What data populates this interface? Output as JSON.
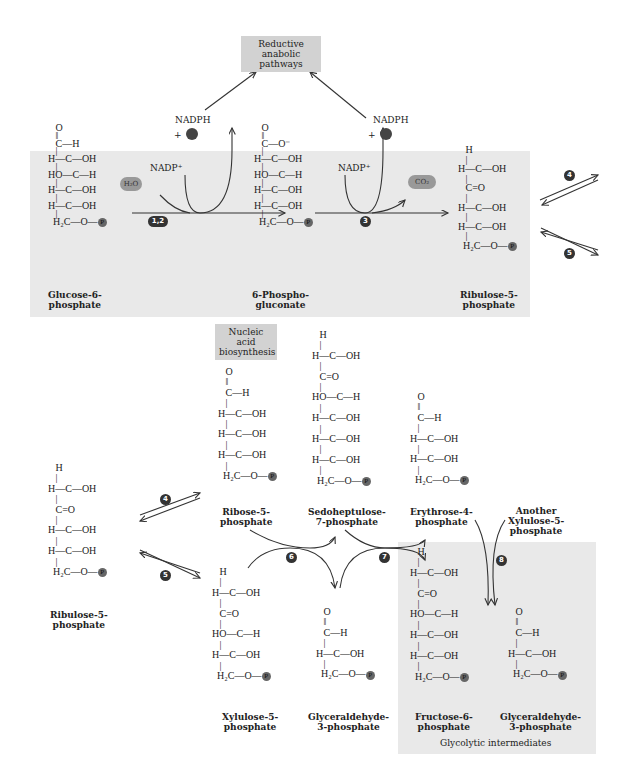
{
  "top_box": "Reductive anabolic pathways",
  "nadph": "NADPH",
  "plus": "+",
  "nadp": "NADP⁺",
  "h2o": "H₂O",
  "co2": "CO₂",
  "nucleic_box": "Nucleic acid biosynthesis",
  "glycolytic_label": "Glycolytic intermediates",
  "steps": {
    "s12": "1,2",
    "s3": "3",
    "s4": "4",
    "s5": "5",
    "s6": "6",
    "s7": "7",
    "s8": "8"
  },
  "molecules": {
    "glucose6p": {
      "name": "Glucose-6-\nphosphate",
      "structure": "   O\n   ‖\n   C—H\n   |\nH—C—OH\n   |\nHO—C—H\n   |\nH—C—OH\n   |\nH—C—OH\n   |\n  H₂C—O—"
    },
    "phosphogluconate": {
      "name": "6-Phospho-\ngluconate",
      "structure": "   O\n   ‖\n   C—O⁻\n   |\nH—C—OH\n   |\nHO—C—H\n   |\nH—C—OH\n   |\nH—C—OH\n   |\n  H₂C—O—"
    },
    "ribulose5p_top": {
      "name": "Ribulose-5-\nphosphate",
      "structure": "   H\n   |\nH—C—OH\n   |\n   C=O\n   |\nH—C—OH\n   |\nH—C—OH\n   |\n  H₂C—O—"
    },
    "ribulose5p_bottom": {
      "name": "Ribulose-5-\nphosphate",
      "structure": "   H\n   |\nH—C—OH\n   |\n   C=O\n   |\nH—C—OH\n   |\nH—C—OH\n   |\n  H₂C—O—"
    },
    "ribose5p": {
      "name": "Ribose-5-\nphosphate",
      "structure": "   O\n   ‖\n   C—H\n   |\nH—C—OH\n   |\nH—C—OH\n   |\nH—C—OH\n   |\n  H₂C—O—"
    },
    "sedoheptulose7p": {
      "name": "Sedoheptulose-\n7-phosphate",
      "structure": "   H\n   |\nH—C—OH\n   |\n   C=O\n   |\nHO—C—H\n   |\nH—C—OH\n   |\nH—C—OH\n   |\nH—C—OH\n   |\n  H₂C—O—"
    },
    "erythrose4p": {
      "name": "Erythrose-4-\nphosphate",
      "structure": "   O\n   ‖\n   C—H\n   |\nH—C—OH\n   |\nH—C—OH\n   |\n  H₂C—O—"
    },
    "xylulose5p": {
      "name": "Xylulose-5-\nphosphate",
      "structure": "   H\n   |\nH—C—OH\n   |\n   C=O\n   |\nHO—C—H\n   |\nH—C—OH\n   |\n  H₂C—O—"
    },
    "gap_mid": {
      "name": "Glyceraldehyde-\n3-phosphate",
      "structure": "   O\n   ‖\n   C—H\n   |\nH—C—OH\n   |\n  H₂C—O—"
    },
    "another_xylulose": {
      "name": "Another\nXylulose-5-\nphosphate"
    },
    "fructose6p": {
      "name": "Fructose-6-\nphosphate",
      "structure": "   H\n   |\nH—C—OH\n   |\n   C=O\n   |\nHO—C—H\n   |\nH—C—OH\n   |\nH—C—OH\n   |\n  H₂C—O—"
    },
    "gap_right": {
      "name": "Glyceraldehyde-\n3-phosphate",
      "structure": "   O\n   ‖\n   C—H\n   |\nH—C—OH\n   |\n  H₂C—O—"
    }
  },
  "phosphate_symbol": "P"
}
